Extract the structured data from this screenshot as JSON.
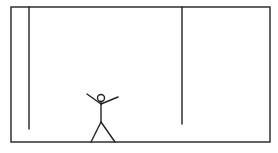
{
  "diagram": {
    "stroke_color": "#222222",
    "background_color": "#ffffff",
    "frame": {
      "x": 11,
      "y": 7,
      "width": 259,
      "height": 135
    },
    "cords": [
      {
        "name": "left-cord",
        "x": 29,
        "y_top": 7,
        "y_bottom": 129
      },
      {
        "name": "right-cord",
        "x": 182,
        "y_top": 7,
        "y_bottom": 124
      }
    ],
    "figure": {
      "head": {
        "cx": 101,
        "cy": 98,
        "r": 3.5
      },
      "neck_y": 102,
      "hip_y": 122,
      "left_hand": {
        "x": 87,
        "y": 94
      },
      "right_hand": {
        "x": 118,
        "y": 97
      },
      "shoulder": {
        "x": 101,
        "y": 104
      },
      "left_foot": {
        "x": 91,
        "y": 142
      },
      "right_foot": {
        "x": 115,
        "y": 142
      }
    }
  }
}
